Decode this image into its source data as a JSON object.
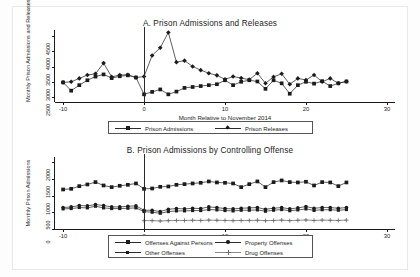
{
  "figure": {
    "width": 420,
    "height": 277,
    "background": "#ffffff",
    "frame_color": "#e8e8e8",
    "ink_color": "#1b1b1b"
  },
  "chart_data": [
    {
      "type": "line",
      "panel": "A",
      "title": "A. Prison Admissions and Releases",
      "xlabel": "Month Relative to November 2014",
      "ylabel": "Monthly Prison Admissions and Releases",
      "xlim": [
        -11,
        31
      ],
      "ylim": [
        2350,
        4700
      ],
      "xticks": [
        -10,
        0,
        10,
        20,
        30
      ],
      "xticklabels": [
        "-10",
        "0",
        "10",
        "20",
        "30"
      ],
      "yticks": [
        2500,
        3000,
        3500,
        4000,
        4500
      ],
      "yticklabels": [
        "2500",
        "3000",
        "3500",
        "4000",
        "4500"
      ],
      "grid": false,
      "legend_position": "below",
      "event_line_x": 0,
      "x": [
        -10,
        -9,
        -8,
        -7,
        -6,
        -5,
        -4,
        -3,
        -2,
        -1,
        0,
        1,
        2,
        3,
        4,
        5,
        6,
        7,
        8,
        9,
        10,
        11,
        12,
        13,
        14,
        15,
        16,
        17,
        18,
        19,
        20,
        21,
        22,
        23,
        24,
        25
      ],
      "series": [
        {
          "name": "Prison Admissions",
          "marker": "square",
          "values": [
            2990,
            2720,
            2900,
            3060,
            3180,
            3250,
            3130,
            3190,
            3220,
            3150,
            2600,
            2680,
            2760,
            2600,
            2690,
            2810,
            2840,
            2870,
            2900,
            2930,
            3060,
            2900,
            3010,
            3060,
            3020,
            2780,
            3060,
            2960,
            2620,
            2900,
            3010,
            2950,
            3030,
            2870,
            2960,
            3020
          ]
        },
        {
          "name": "Prison Releases",
          "marker": "diamond",
          "values": [
            2990,
            3010,
            3120,
            3230,
            3270,
            3620,
            3170,
            3230,
            3240,
            3150,
            3180,
            3870,
            4120,
            4620,
            3650,
            3700,
            3510,
            3390,
            3290,
            3220,
            3090,
            3180,
            3130,
            3080,
            3290,
            2960,
            3170,
            3270,
            2930,
            3120,
            3070,
            3230,
            3010,
            3120,
            2960,
            3020
          ]
        }
      ]
    },
    {
      "type": "line",
      "panel": "B",
      "title": "B. Prison Admissions by Controlling Offense",
      "xlabel": "Month Relative to November 2014",
      "ylabel": "Monthly Prison Admissions",
      "xlim": [
        -11,
        31
      ],
      "ylim": [
        0,
        2150
      ],
      "xticks": [
        -10,
        0,
        10,
        20,
        30
      ],
      "xticklabels": [
        "-10",
        "0",
        "10",
        "20",
        "30"
      ],
      "yticks": [
        0,
        500,
        1000,
        1500,
        2000
      ],
      "yticklabels": [
        "0",
        "500",
        "1000",
        "1500",
        "2000"
      ],
      "grid": false,
      "legend_position": "below",
      "event_line_x": 0,
      "x": [
        -10,
        -9,
        -8,
        -7,
        -6,
        -5,
        -4,
        -3,
        -2,
        -1,
        0,
        1,
        2,
        3,
        4,
        5,
        6,
        7,
        8,
        9,
        10,
        11,
        12,
        13,
        14,
        15,
        16,
        17,
        18,
        19,
        20,
        21,
        22,
        23,
        24,
        25
      ],
      "series": [
        {
          "name": "Offenses Against Persons",
          "marker": "square",
          "values": [
            1180,
            1200,
            1280,
            1330,
            1400,
            1300,
            1250,
            1290,
            1320,
            1360,
            1200,
            1210,
            1260,
            1270,
            1320,
            1340,
            1360,
            1380,
            1420,
            1390,
            1380,
            1360,
            1250,
            1340,
            1420,
            1250,
            1400,
            1450,
            1400,
            1390,
            1410,
            1300,
            1400,
            1390,
            1280,
            1390
          ]
        },
        {
          "name": "Property Offenses",
          "marker": "circle",
          "values": [
            640,
            660,
            700,
            690,
            730,
            700,
            660,
            660,
            680,
            690,
            560,
            560,
            520,
            590,
            610,
            600,
            620,
            610,
            660,
            640,
            610,
            600,
            620,
            630,
            640,
            590,
            620,
            640,
            600,
            630,
            670,
            620,
            640,
            640,
            620,
            640
          ]
        },
        {
          "name": "Other Offenses",
          "marker": "square-small",
          "values": [
            600,
            610,
            640,
            630,
            680,
            630,
            610,
            610,
            620,
            630,
            520,
            500,
            470,
            520,
            540,
            540,
            550,
            550,
            580,
            570,
            550,
            540,
            560,
            560,
            570,
            530,
            560,
            580,
            545,
            570,
            600,
            555,
            575,
            575,
            560,
            580
          ]
        },
        {
          "name": "Drug Offenses",
          "marker": "plus",
          "values": [
            null,
            null,
            null,
            null,
            null,
            null,
            null,
            null,
            null,
            null,
            250,
            250,
            240,
            250,
            255,
            255,
            260,
            255,
            265,
            260,
            255,
            250,
            255,
            255,
            260,
            250,
            255,
            265,
            250,
            260,
            270,
            255,
            265,
            260,
            255,
            265
          ]
        }
      ]
    }
  ],
  "legends": {
    "panelA": [
      {
        "label": "Prison Admissions",
        "marker": "square"
      },
      {
        "label": "Prison Releases",
        "marker": "diamond"
      }
    ],
    "panelB": [
      {
        "label": "Offenses Against Persons",
        "marker": "square"
      },
      {
        "label": "Property Offenses",
        "marker": "circle"
      },
      {
        "label": "Other Offenses",
        "marker": "square-small"
      },
      {
        "label": "Drug Offenses",
        "marker": "plus"
      }
    ]
  }
}
